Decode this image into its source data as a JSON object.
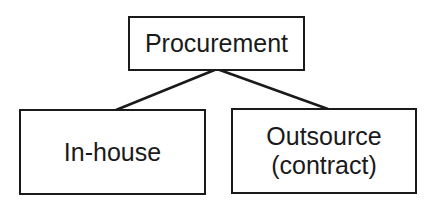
{
  "diagram": {
    "type": "hierarchy",
    "root": {
      "label": "Procurement"
    },
    "children": [
      {
        "label": "In-house"
      },
      {
        "label_line1": "Outsource",
        "label_line2": "(contract)"
      }
    ],
    "colors": {
      "stroke": "#1a1a1a",
      "background": "#ffffff"
    }
  }
}
